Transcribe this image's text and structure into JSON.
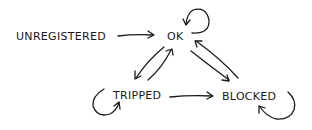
{
  "diagram": {
    "type": "state-diagram",
    "style": "hand-drawn",
    "stroke_color": "#1a1a1a",
    "background": "#ffffff",
    "nodes": [
      {
        "id": "unregistered",
        "label": "UNREGISTERED"
      },
      {
        "id": "ok",
        "label": "OK"
      },
      {
        "id": "tripped",
        "label": "TRIPPED"
      },
      {
        "id": "blocked",
        "label": "BLOCKED"
      }
    ],
    "edges": [
      {
        "from": "unregistered",
        "to": "ok"
      },
      {
        "from": "ok",
        "to": "ok"
      },
      {
        "from": "ok",
        "to": "tripped"
      },
      {
        "from": "tripped",
        "to": "ok"
      },
      {
        "from": "ok",
        "to": "blocked"
      },
      {
        "from": "blocked",
        "to": "ok"
      },
      {
        "from": "tripped",
        "to": "blocked"
      },
      {
        "from": "tripped",
        "to": "tripped"
      },
      {
        "from": "blocked",
        "to": "blocked"
      }
    ]
  }
}
